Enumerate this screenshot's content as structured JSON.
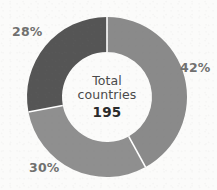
{
  "chart_data": {
    "type": "pie",
    "variant": "donut",
    "title": "",
    "subtitle": "",
    "xlabel": "",
    "ylabel": "",
    "center_label_line1": "Total",
    "center_label_line2": "countries",
    "center_value": "195",
    "total": 195,
    "legend_position": "none",
    "grid": false,
    "start_angle_deg": 0,
    "direction": "clockwise",
    "categories": [
      "42%",
      "30%",
      "28%"
    ],
    "values": [
      42,
      30,
      28
    ],
    "slices": [
      {
        "label": "42%",
        "value": 42,
        "color": "#8a8a8a",
        "start_angle_deg": 0,
        "end_angle_deg": 151.2,
        "label_position": "right"
      },
      {
        "label": "30%",
        "value": 30,
        "color": "#8f8f8f",
        "start_angle_deg": 151.2,
        "end_angle_deg": 259.2,
        "label_position": "bottom-left"
      },
      {
        "label": "28%",
        "value": 28,
        "color": "#555555",
        "start_angle_deg": 259.2,
        "end_angle_deg": 360,
        "label_position": "top-left"
      }
    ],
    "geometry": {
      "center_x": 107,
      "center_y": 97,
      "outer_radius": 80,
      "inner_radius": 45,
      "divider_color": "#ffffff",
      "divider_width": 1.6
    },
    "colors": {
      "background": "#fbfbfa",
      "label_text": "#70706f",
      "center_text": "#4a4a4a",
      "center_value_text": "#2b2b2b",
      "slice_dark": "#555555",
      "slice_mid": "#8a8a8a",
      "slice_mid_light": "#8f8f8f"
    }
  }
}
